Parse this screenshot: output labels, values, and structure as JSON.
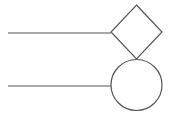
{
  "diagram": {
    "background": "#ffffff",
    "stroke_color": "#555555",
    "shapes": [
      {
        "type": "line",
        "name": "top-connector-line",
        "x1": 8,
        "y1": 33,
        "x2": 111,
        "y2": 33
      },
      {
        "type": "diamond",
        "name": "decision-diamond",
        "cx": 136.5,
        "cy": 32,
        "half_w": 25.5,
        "half_h": 27
      },
      {
        "type": "line",
        "name": "bottom-connector-line",
        "x1": 8,
        "y1": 86,
        "x2": 111,
        "y2": 86
      },
      {
        "type": "circle",
        "name": "node-circle",
        "cx": 136.5,
        "cy": 85,
        "r": 25.5
      }
    ]
  }
}
